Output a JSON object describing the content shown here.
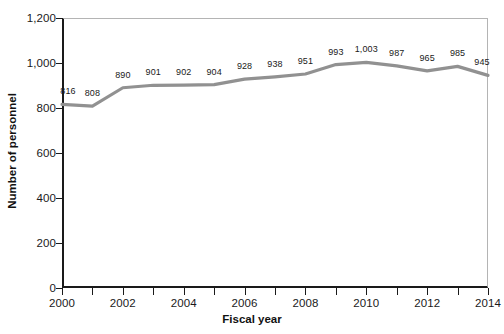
{
  "chart_data": {
    "type": "line",
    "title": "",
    "xlabel": "Fiscal year",
    "ylabel": "Number of personnel",
    "x": [
      2000,
      2001,
      2002,
      2003,
      2004,
      2005,
      2006,
      2007,
      2008,
      2009,
      2010,
      2011,
      2012,
      2013,
      2014
    ],
    "values": [
      816,
      808,
      890,
      901,
      902,
      904,
      928,
      938,
      951,
      993,
      1003,
      987,
      965,
      985,
      945
    ],
    "point_labels": [
      "816",
      "808",
      "890",
      "901",
      "902",
      "904",
      "928",
      "938",
      "951",
      "993",
      "1,003",
      "987",
      "965",
      "985",
      "945"
    ],
    "series": [
      {
        "name": "Number of personnel",
        "values": [
          816,
          808,
          890,
          901,
          902,
          904,
          928,
          938,
          951,
          993,
          1003,
          987,
          965,
          985,
          945
        ],
        "color": "#919191"
      }
    ],
    "ylim": [
      0,
      1200
    ],
    "xlim": [
      2000,
      2014
    ],
    "ytick_values": [
      0,
      200,
      400,
      600,
      800,
      1000,
      1200
    ],
    "ytick_labels": [
      "0",
      "200",
      "400",
      "600",
      "800",
      "1,000",
      "1,200"
    ],
    "xtick_values": [
      2000,
      2001,
      2002,
      2003,
      2004,
      2005,
      2006,
      2007,
      2008,
      2009,
      2010,
      2011,
      2012,
      2013,
      2014
    ],
    "xtick_labels": [
      "2000",
      "",
      "2002",
      "",
      "2004",
      "",
      "2006",
      "",
      "2008",
      "",
      "2010",
      "",
      "2012",
      "",
      "2014"
    ],
    "grid": false,
    "legend": false,
    "legend_position": "none",
    "line_color": "#919191",
    "axis_color": "#1a1a1a",
    "frame_color": "#b4b4b4",
    "background": "#ffffff"
  }
}
